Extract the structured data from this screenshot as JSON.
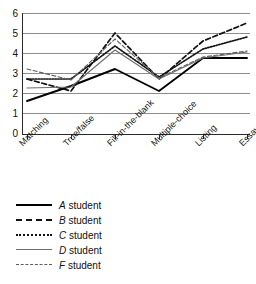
{
  "chart_data": {
    "type": "line",
    "title": "",
    "xlabel": "",
    "ylabel": "",
    "ylim": [
      0,
      6
    ],
    "yticks": [
      0,
      1,
      2,
      3,
      4,
      5,
      6
    ],
    "grid": true,
    "legend_position": "below-left",
    "categories": [
      "Matching",
      "True/false",
      "Fill-in-the-blank",
      "Multiple-choice",
      "Listing",
      "Essay"
    ],
    "series": [
      {
        "name": "A student",
        "style": "solid",
        "color": "#000000",
        "values": [
          1.6,
          2.35,
          3.2,
          2.1,
          3.75,
          3.75
        ]
      },
      {
        "name": "B student",
        "style": "dashed",
        "color": "#111111",
        "values": [
          2.7,
          2.1,
          5.0,
          2.7,
          4.6,
          5.5
        ]
      },
      {
        "name": "C student",
        "style": "dotted",
        "color": "#111111",
        "values": [
          2.7,
          2.7,
          4.35,
          2.8,
          4.2,
          4.8
        ]
      },
      {
        "name": "D student",
        "style": "solid",
        "color": "#6e6e6e",
        "values": [
          2.25,
          2.3,
          4.15,
          2.7,
          3.75,
          4.05
        ]
      },
      {
        "name": "F student",
        "style": "dashed",
        "color": "#5f5f5f",
        "values": [
          3.2,
          2.65,
          4.7,
          2.75,
          3.8,
          4.1
        ]
      }
    ]
  },
  "yaxis": {
    "ticks": [
      "6",
      "5",
      "4",
      "3",
      "2",
      "1",
      "0"
    ]
  },
  "xaxis": {
    "categories": [
      "Matching",
      "True/false",
      "Fill-in-the-blank",
      "Multiple-choice",
      "Listing",
      "Essay"
    ]
  },
  "legend": {
    "items": [
      {
        "label_italic": "A",
        "label_rest": " student"
      },
      {
        "label_italic": "B",
        "label_rest": " student"
      },
      {
        "label_italic": "C",
        "label_rest": " student"
      },
      {
        "label_italic": "D",
        "label_rest": " student"
      },
      {
        "label_italic": "F",
        "label_rest": " student"
      }
    ]
  },
  "caption": {
    "text": ""
  }
}
